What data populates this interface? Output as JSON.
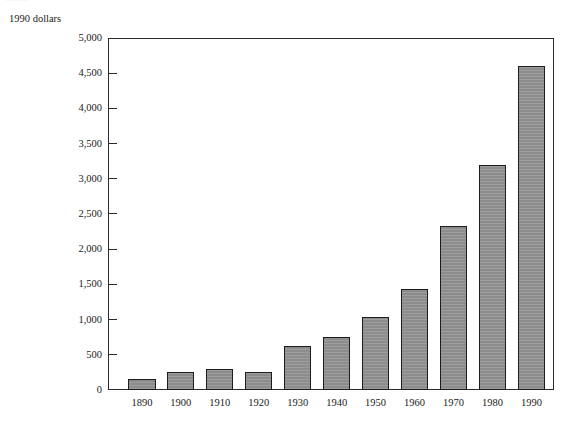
{
  "figure": {
    "unit_label": "1990 dollars",
    "cut_off_caption": "........."
  },
  "chart_data": {
    "type": "bar",
    "title": "",
    "subtitle": "",
    "xlabel": "",
    "ylabel": "1990 dollars",
    "categories": [
      "1890",
      "1900",
      "1910",
      "1920",
      "1930",
      "1940",
      "1950",
      "1960",
      "1970",
      "1980",
      "1990"
    ],
    "values": [
      150,
      250,
      300,
      260,
      630,
      750,
      1040,
      1440,
      2330,
      3200,
      4600
    ],
    "ylim": [
      0,
      5000
    ],
    "ytick_values": [
      0,
      500,
      1000,
      1500,
      2000,
      2500,
      3000,
      3500,
      4000,
      4500,
      5000
    ],
    "ytick_labels": [
      "0",
      "500",
      "1,000",
      "1,500",
      "2,000",
      "2,500",
      "3,000",
      "3,500",
      "4,000",
      "4,500",
      "5,000"
    ],
    "grid": false,
    "legend": null,
    "legend_position": "none",
    "bar_fill_color": "#8c8c8c",
    "bar_edge_color": "#1c1c1c",
    "axis_color": "#2b2b2b",
    "background_color": "#ffffff",
    "annotations": []
  }
}
